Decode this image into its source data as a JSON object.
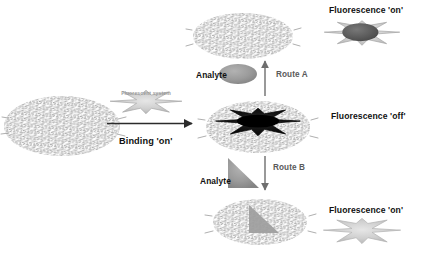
{
  "figure": {
    "type": "mechanism-diagram",
    "background_color": "#ffffff"
  },
  "labels": {
    "binding_on": "Binding 'on'",
    "fluorescent_system": "Fluorescent system",
    "analyte_a": "Analyte",
    "analyte_b": "Analyte",
    "route_a": "Route A",
    "route_b": "Route B",
    "fluorescence_on_top": "Fluorescence 'on'",
    "fluorescence_off": "Fluorescence 'off'",
    "fluorescence_on_bottom": "Fluorescence 'on'"
  },
  "colors": {
    "polymer_mark": "#8c8c8c",
    "star_light": "#c9c9c9",
    "star_mid": "#b4b4b4",
    "star_dark": "#1c1c1c",
    "analyte_ellipse": "#9d9d9d",
    "analyte_triangle": "#9d9d9d",
    "arrow": "#2b2b2b",
    "route_arrow": "#6e6e6e",
    "text": "#111111",
    "route_text": "#5a5a5a"
  },
  "shapes": {
    "polymer_left": {
      "name": "polymer-matrix-left",
      "cx": 62,
      "cy": 126,
      "rx": 58,
      "ry": 30,
      "contains": "none"
    },
    "polymer_top": {
      "name": "polymer-matrix-top",
      "cx": 243,
      "cy": 36,
      "rx": 50,
      "ry": 23,
      "contains": "none"
    },
    "polymer_center": {
      "name": "polymer-matrix-center",
      "cx": 258,
      "cy": 127,
      "rx": 52,
      "ry": 26,
      "contains": "dark-star"
    },
    "polymer_bottom": {
      "name": "polymer-matrix-bottom",
      "cx": 260,
      "cy": 222,
      "rx": 47,
      "ry": 23,
      "contains": "triangle-analyte"
    },
    "star_probe_binding": {
      "name": "fluorescent-star-probe",
      "cx": 146,
      "cy": 102,
      "state": "light"
    },
    "star_top_right": {
      "name": "fluorescent-star-on-top",
      "cx": 362,
      "cy": 33,
      "state": "light-with-dark-ellipse"
    },
    "star_bottom_right": {
      "name": "fluorescent-star-on-bottom",
      "cx": 362,
      "cy": 231,
      "state": "light"
    },
    "analyte_ellipse": {
      "name": "analyte-ellipse",
      "cx": 238,
      "cy": 74,
      "rx": 19,
      "ry": 10
    },
    "analyte_triangle": {
      "name": "analyte-triangle",
      "x": 228,
      "y": 158,
      "w": 30,
      "h": 30
    }
  },
  "arrows": {
    "binding": {
      "name": "binding-arrow",
      "direction": "right",
      "x1": 107,
      "y1": 123,
      "x2": 194,
      "y2": 123
    },
    "route_a": {
      "name": "route-a-arrow",
      "direction": "up",
      "x1": 265,
      "y1": 95,
      "x2": 265,
      "y2": 60
    },
    "route_b": {
      "name": "route-b-arrow",
      "direction": "down",
      "x1": 265,
      "y1": 158,
      "x2": 265,
      "y2": 190
    }
  }
}
